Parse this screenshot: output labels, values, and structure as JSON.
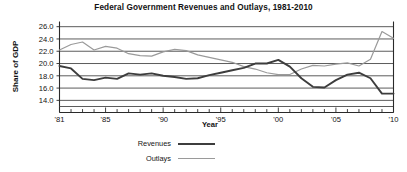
{
  "chart_data": {
    "type": "line",
    "title": "Federal Government Revenues and Outlays, 1981-2010",
    "xlabel": "Year",
    "ylabel": "Share of GDP",
    "xlim": [
      1981,
      2010
    ],
    "ylim": [
      13.0,
      26.6
    ],
    "grid": true,
    "legend_position": "below-left",
    "x": [
      1981,
      1982,
      1983,
      1984,
      1985,
      1986,
      1987,
      1988,
      1989,
      1990,
      1991,
      1992,
      1993,
      1994,
      1995,
      1996,
      1997,
      1998,
      1999,
      2000,
      2001,
      2002,
      2003,
      2004,
      2005,
      2006,
      2007,
      2008,
      2009,
      2010
    ],
    "xtick_values": [
      1981,
      1985,
      1990,
      1995,
      2000,
      2005,
      2010
    ],
    "xtick_labels": [
      "'81",
      "'85",
      "'90",
      "'95",
      "'00",
      "'05",
      "'10"
    ],
    "xtick_minor_step": 1,
    "ytick_values": [
      14.0,
      16.0,
      18.0,
      20.0,
      22.0,
      24.0,
      26.0
    ],
    "ytick_labels": [
      "14.0",
      "16.0",
      "18.0",
      "20.0",
      "22.0",
      "24.0",
      "26.0"
    ],
    "series": [
      {
        "name": "Revenues",
        "color": "#3d3d3d",
        "width": 1.9,
        "values": [
          19.6,
          19.2,
          17.5,
          17.3,
          17.7,
          17.5,
          18.4,
          18.2,
          18.4,
          18.0,
          17.8,
          17.5,
          17.6,
          18.1,
          18.5,
          18.9,
          19.3,
          20.0,
          20.0,
          20.6,
          19.5,
          17.6,
          16.2,
          16.1,
          17.3,
          18.2,
          18.5,
          17.6,
          15.1,
          15.1
        ]
      },
      {
        "name": "Outlays",
        "color": "#9a9a9a",
        "width": 1.2,
        "values": [
          22.2,
          23.1,
          23.5,
          22.2,
          22.8,
          22.5,
          21.6,
          21.3,
          21.2,
          21.9,
          22.3,
          22.1,
          21.4,
          21.0,
          20.6,
          20.2,
          19.5,
          19.1,
          18.5,
          18.2,
          18.2,
          19.1,
          19.7,
          19.6,
          19.9,
          20.1,
          19.6,
          20.7,
          25.2,
          24.1
        ]
      }
    ]
  },
  "legend": {
    "items": [
      {
        "label": "Revenues"
      },
      {
        "label": "Outlays"
      }
    ]
  }
}
